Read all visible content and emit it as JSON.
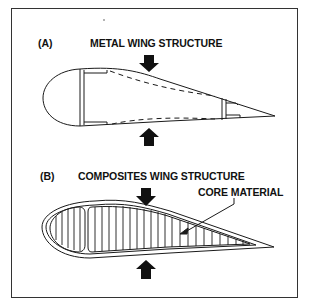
{
  "figure": {
    "panel_a": {
      "tag": "(A)",
      "title": "METAL WING STRUCTURE"
    },
    "panel_b": {
      "tag": "(B)",
      "title": "COMPOSITES WING STRUCTURE",
      "callout": "CORE MATERIAL"
    }
  },
  "colors": {
    "line": "#1a1a1a",
    "background": "#ffffff"
  }
}
